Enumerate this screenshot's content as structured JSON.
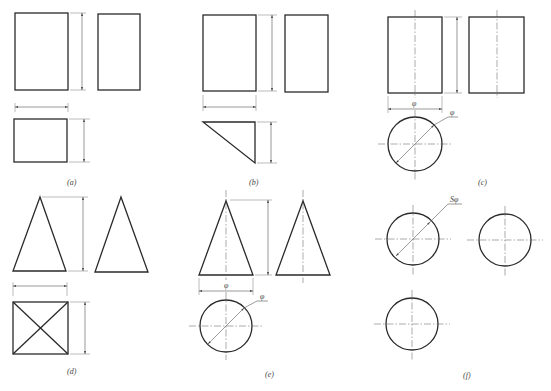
{
  "figure": {
    "panels": [
      {
        "id": "a",
        "caption": "(a)",
        "shape": "rectangular prism (cuboid)"
      },
      {
        "id": "b",
        "caption": "(b)",
        "shape": "triangular prism"
      },
      {
        "id": "c",
        "caption": "(c)",
        "shape": "cylinder",
        "dim_symbols": [
          "φ",
          "φ"
        ]
      },
      {
        "id": "d",
        "caption": "(d)",
        "shape": "square pyramid"
      },
      {
        "id": "e",
        "caption": "(e)",
        "shape": "cone",
        "dim_symbols": [
          "φ",
          "φ"
        ]
      },
      {
        "id": "f",
        "caption": "(f)",
        "shape": "sphere",
        "dim_symbols": [
          "Sφ"
        ]
      }
    ]
  },
  "colors": {
    "line": "#2a2a2a",
    "dimension": "#555555",
    "background": "#ffffff"
  }
}
